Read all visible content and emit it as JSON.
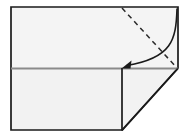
{
  "diagram": {
    "type": "origami-fold-instruction",
    "canvas": {
      "width": 188,
      "height": 137
    },
    "colors": {
      "background": "#ffffff",
      "paper_fill": "#f4f4f4",
      "paper_fill_lower": "#f2f2f2",
      "outline": "#1a1a1a",
      "crease_line": "#8a8a8a",
      "fold_line_dashed": "#2a2a2a",
      "arrow": "#1a1a1a"
    },
    "sheet": {
      "label": "paper-sheet",
      "top_left": [
        11,
        7
      ],
      "top_right": [
        178,
        7
      ],
      "bottom_right_of_upper": [
        178,
        68
      ],
      "bottom_left": [
        11,
        130
      ],
      "bottom_edge_end": [
        122,
        130
      ],
      "diagonal_cut_end": [
        178,
        68
      ]
    },
    "crease": {
      "label": "horizontal-crease",
      "from": [
        11,
        68
      ],
      "to": [
        178,
        68
      ],
      "style": "solid-gray"
    },
    "vertical_edge": {
      "label": "vertical-edge",
      "from": [
        122,
        68
      ],
      "to": [
        122,
        130
      ],
      "style": "solid-dark"
    },
    "diagonal_edge": {
      "label": "diagonal-edge",
      "from": [
        178,
        68
      ],
      "to": [
        122,
        130
      ],
      "style": "solid-dark"
    },
    "fold_line": {
      "label": "dashed-fold-line",
      "from": [
        122,
        8
      ],
      "to": [
        177,
        68
      ],
      "style": "dashed",
      "dash_pattern": "5 4"
    },
    "fold_arrow": {
      "label": "curved-fold-arrow",
      "start": [
        177,
        9
      ],
      "control": [
        172,
        58
      ],
      "end": [
        124,
        66
      ],
      "direction": "down-left",
      "arrowhead_at": "end"
    }
  }
}
